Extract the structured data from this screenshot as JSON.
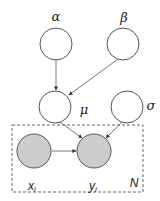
{
  "diagram": {
    "type": "plate-notation-graphical-model",
    "colors": {
      "observed_fill": "#cccccc",
      "latent_fill": "#ffffff",
      "stroke": "#555555",
      "plate_stroke": "#666666"
    },
    "nodes": [
      {
        "id": "alpha",
        "label": "α",
        "observed": false
      },
      {
        "id": "beta",
        "label": "β",
        "observed": false
      },
      {
        "id": "mu",
        "label": "μ",
        "observed": false
      },
      {
        "id": "sigma",
        "label": "σ",
        "observed": false
      },
      {
        "id": "x_i",
        "label": "x",
        "subscript": "i",
        "observed": true
      },
      {
        "id": "y_i",
        "label": "y",
        "subscript": "i",
        "observed": true
      }
    ],
    "edges": [
      {
        "from": "alpha",
        "to": "mu"
      },
      {
        "from": "beta",
        "to": "mu"
      },
      {
        "from": "mu",
        "to": "y_i"
      },
      {
        "from": "sigma",
        "to": "y_i"
      },
      {
        "from": "x_i",
        "to": "y_i"
      }
    ],
    "plate": {
      "label": "N",
      "contains": [
        "x_i",
        "y_i"
      ]
    }
  }
}
